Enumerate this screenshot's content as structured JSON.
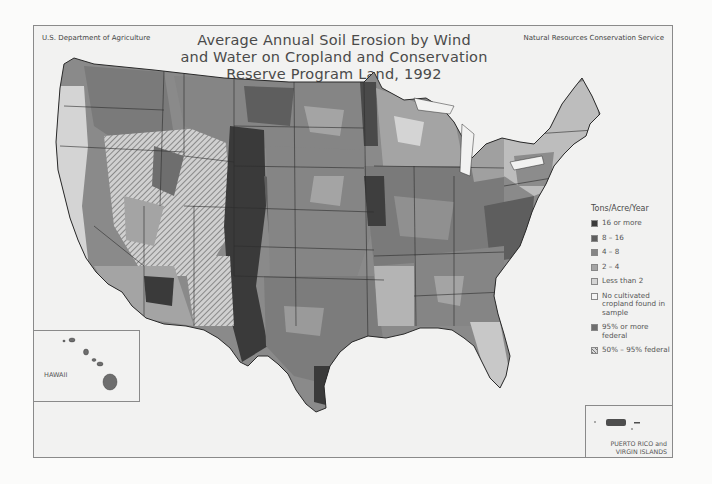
{
  "header": {
    "agency_left": "U.S. Department of Agriculture",
    "agency_right": "Natural Resources Conservation Service",
    "title_lines": [
      "Average Annual Soil Erosion by Wind",
      "and Water on Cropland and Conservation",
      "Reserve Program Land, 1992"
    ]
  },
  "legend": {
    "heading": "Tons/Acre/Year",
    "items": [
      {
        "label": "16 or more",
        "color": "#3a3a3a",
        "pattern": "solid"
      },
      {
        "label": "8 – 16",
        "color": "#5e5e5e",
        "pattern": "solid"
      },
      {
        "label": "4 – 8",
        "color": "#858585",
        "pattern": "solid"
      },
      {
        "label": "2 – 4",
        "color": "#a4a4a4",
        "pattern": "solid"
      },
      {
        "label": "Less than 2",
        "color": "#d4d4d4",
        "pattern": "solid"
      },
      {
        "label": "No cultivated cropland found in sample",
        "color": "#f4f4f4",
        "pattern": "solid"
      },
      {
        "label": "95% or more federal",
        "color": "#6e6e6e",
        "pattern": "solid"
      },
      {
        "label": "50% – 95% federal",
        "color": "#cfcfcf",
        "pattern": "hatch"
      }
    ]
  },
  "insets": {
    "hawaii_label": "HAWAII",
    "pr_label_line1": "PUERTO RICO and",
    "pr_label_line2": "VIRGIN ISLANDS"
  },
  "map": {
    "region": "Conterminous United States",
    "year": "1992",
    "colors": {
      "background": "#f2f2f1",
      "state_border": "#2e2e2e",
      "very_high": "#3a3a3a",
      "high": "#5e5e5e",
      "moderate": "#858585",
      "low": "#a4a4a4",
      "very_low": "#d4d4d4"
    }
  }
}
